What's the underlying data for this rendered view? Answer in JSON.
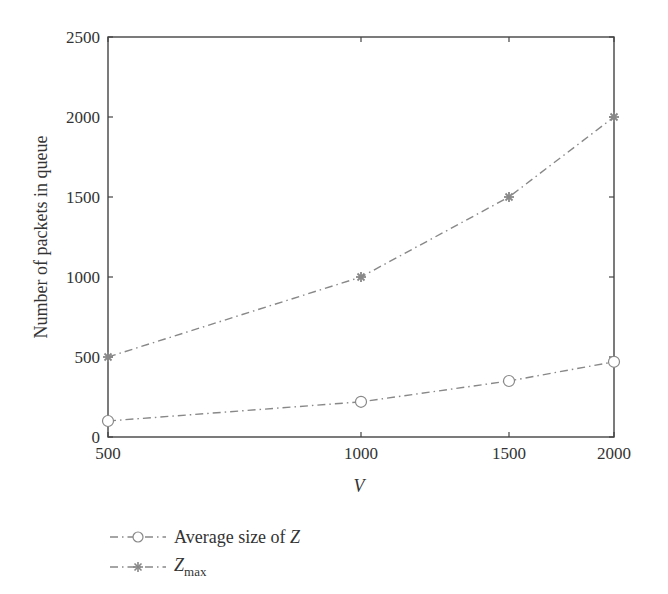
{
  "chart_data": {
    "type": "line",
    "title": "",
    "xlabel": "V",
    "ylabel": "Number of packets in queue",
    "x_scale": "log",
    "xlim": [
      500,
      2000
    ],
    "ylim": [
      0,
      2500
    ],
    "x_ticks": [
      "500",
      "1000",
      "1500",
      "2000"
    ],
    "y_ticks": [
      "0",
      "500",
      "1000",
      "1500",
      "2000",
      "2500"
    ],
    "x": [
      500,
      1000,
      1500,
      2000
    ],
    "series": [
      {
        "name": "Average size of Z",
        "marker": "circle",
        "line_style": "dash-dot",
        "color": "#888888",
        "values": [
          100,
          220,
          350,
          470
        ]
      },
      {
        "name": "Zmax",
        "marker": "star",
        "line_style": "dash-dot",
        "color": "#888888",
        "values": [
          500,
          1000,
          1500,
          2000
        ]
      }
    ],
    "grid": false,
    "legend_position": "below-left"
  },
  "legend": {
    "item0_prefix": "Average size of ",
    "item0_var": "Z",
    "item1_var": "Z",
    "item1_sub": "max"
  }
}
